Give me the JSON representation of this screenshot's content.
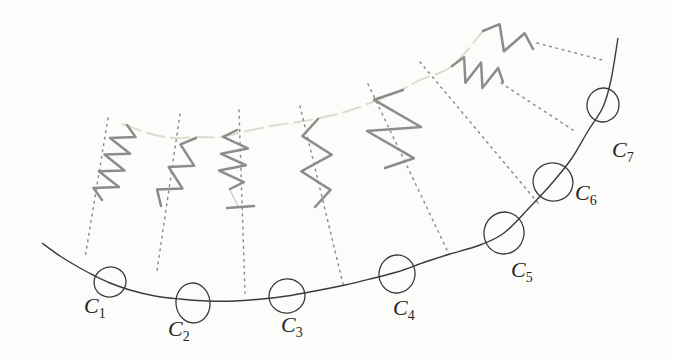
{
  "figure": {
    "description_label": "Curve with osculating circles and spring normals",
    "colors": {
      "background": "#fcfcfa",
      "ink": "#3b3b3b",
      "spring_gray": "#8c8c8c",
      "dotted_gray": "#8d8d8d",
      "chain_faint": "#dcd8c9",
      "label_ink": "#242424"
    },
    "curve_points": [
      [
        42,
        243
      ],
      [
        60,
        256
      ],
      [
        80,
        268
      ],
      [
        95,
        276
      ],
      [
        110,
        283
      ],
      [
        130,
        290
      ],
      [
        155,
        296
      ],
      [
        180,
        299
      ],
      [
        207,
        301
      ],
      [
        235,
        301
      ],
      [
        262,
        299
      ],
      [
        287,
        296
      ],
      [
        315,
        291
      ],
      [
        345,
        285
      ],
      [
        370,
        279
      ],
      [
        397,
        272
      ],
      [
        425,
        262
      ],
      [
        450,
        254
      ],
      [
        480,
        245
      ],
      [
        504,
        233
      ],
      [
        530,
        207
      ],
      [
        553,
        182
      ],
      [
        572,
        158
      ],
      [
        588,
        131
      ],
      [
        603,
        107
      ],
      [
        611,
        80
      ],
      [
        618,
        38
      ]
    ],
    "chain_points": [
      [
        122,
        124
      ],
      [
        148,
        133
      ],
      [
        172,
        138
      ],
      [
        197,
        137
      ],
      [
        220,
        137
      ],
      [
        247,
        131
      ],
      [
        277,
        125
      ],
      [
        298,
        122
      ],
      [
        320,
        118
      ],
      [
        345,
        112
      ],
      [
        370,
        103
      ],
      [
        397,
        92
      ],
      [
        420,
        80
      ],
      [
        452,
        66
      ],
      [
        483,
        31
      ]
    ],
    "springs": [
      {
        "x1": 127,
        "y1": 125,
        "x2": 102,
        "y2": 200,
        "verts": 8,
        "amp": 12,
        "s0": -1
      },
      {
        "x1": 196,
        "y1": 138,
        "x2": 161,
        "y2": 206,
        "verts": 5,
        "amp": 11,
        "s0": 1
      },
      {
        "x1": 237,
        "y1": 130,
        "x2": 230,
        "y2": 189,
        "verts": 6,
        "amp": 13,
        "s0": 1
      },
      {
        "x1": 318,
        "y1": 119,
        "x2": 315,
        "y2": 207,
        "verts": 4,
        "amp": 15,
        "s0": 1
      },
      {
        "x1": 403,
        "y1": 90,
        "x2": 385,
        "y2": 168,
        "verts": 4,
        "amp": 26,
        "s0": 1
      },
      {
        "x1": 452,
        "y1": 66,
        "x2": 503,
        "y2": 82,
        "verts": 5,
        "amp": 12,
        "s0": -1
      },
      {
        "x1": 483,
        "y1": 31,
        "x2": 533,
        "y2": 49,
        "verts": 3,
        "amp": 12,
        "s0": -1
      }
    ],
    "spring3_footer": {
      "bar": [
        227,
        208,
        254,
        206
      ],
      "link": [
        230,
        190,
        238,
        206
      ]
    },
    "dotted_normals": [
      [
        108,
        118,
        85,
        258
      ],
      [
        180,
        114,
        157,
        271
      ],
      [
        239,
        110,
        245,
        293
      ],
      [
        300,
        106,
        343,
        284
      ],
      [
        368,
        84,
        448,
        252
      ],
      [
        420,
        62,
        538,
        203
      ],
      [
        501,
        83,
        576,
        132
      ],
      [
        537,
        43,
        606,
        61
      ]
    ],
    "circles": [
      {
        "letter": "C",
        "sub": "1",
        "cx": 110,
        "cy": 282,
        "rx": 16,
        "ry": 15,
        "rot": -15,
        "lx": 84,
        "ly": 313
      },
      {
        "letter": "C",
        "sub": "2",
        "cx": 193,
        "cy": 303,
        "rx": 17,
        "ry": 20,
        "rot": -6,
        "lx": 168,
        "ly": 336
      },
      {
        "letter": "C",
        "sub": "3",
        "cx": 287,
        "cy": 296,
        "rx": 18,
        "ry": 17,
        "rot": -8,
        "lx": 281,
        "ly": 332
      },
      {
        "letter": "C",
        "sub": "4",
        "cx": 397,
        "cy": 274,
        "rx": 18,
        "ry": 19,
        "rot": 8,
        "lx": 393,
        "ly": 315
      },
      {
        "letter": "C",
        "sub": "5",
        "cx": 504,
        "cy": 233,
        "rx": 20,
        "ry": 21,
        "rot": 14,
        "lx": 511,
        "ly": 277
      },
      {
        "letter": "C",
        "sub": "6",
        "cx": 553,
        "cy": 182,
        "rx": 20,
        "ry": 19,
        "rot": 18,
        "lx": 575,
        "ly": 200
      },
      {
        "letter": "C",
        "sub": "7",
        "cx": 603,
        "cy": 105,
        "rx": 16,
        "ry": 17,
        "rot": 10,
        "lx": 612,
        "ly": 157
      }
    ]
  }
}
